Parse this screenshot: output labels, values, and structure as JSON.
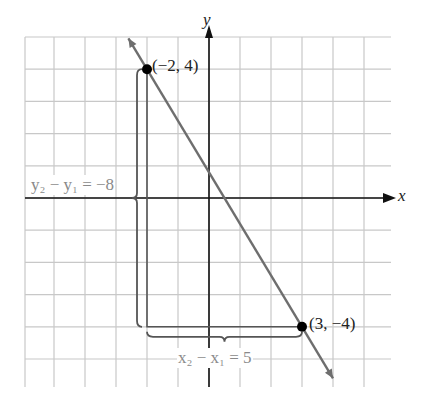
{
  "chart_data": {
    "type": "line",
    "title": "",
    "xlabel": "x",
    "ylabel": "y",
    "xlim": [
      -6,
      6
    ],
    "ylim": [
      -6,
      5
    ],
    "grid": true,
    "points": [
      {
        "x": -2,
        "y": 4,
        "label": "(−2, 4)"
      },
      {
        "x": 3,
        "y": -4,
        "label": "(3, −4)"
      }
    ],
    "line": {
      "through": [
        [
          -2,
          4
        ],
        [
          3,
          -4
        ]
      ],
      "slope": -1.6
    },
    "annotations": {
      "vertical_change": "y₂ − y₁ = −8",
      "horizontal_change": "x₂ − x₁ = 5"
    }
  },
  "labels": {
    "x_axis": "x",
    "y_axis": "y",
    "point1": "(−2, 4)",
    "point2": "(3, −4)",
    "rise_label": "y₂ − y₁ = −8",
    "run_label": "x₂ − x₁ = 5"
  },
  "colors": {
    "grid": "#c8c8c8",
    "axis": "#111111",
    "line": "#6e6e6e",
    "bracket": "#555555",
    "annotation_text": "#8a8a8a"
  }
}
